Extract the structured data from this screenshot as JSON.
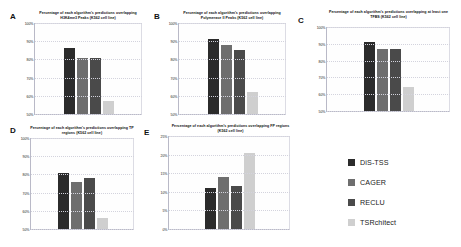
{
  "figure": {
    "background": "#ffffff",
    "series_colors": [
      "#2b2b2b",
      "#6e6e6e",
      "#4a4a4a",
      "#cfcfcf"
    ],
    "series_names": [
      "DiS-TSS",
      "CAGER",
      "RECLU",
      "TSRchitect"
    ]
  },
  "legend": {
    "items": [
      {
        "label": "DiS-TSS",
        "color": "#2b2b2b"
      },
      {
        "label": "CAGER",
        "color": "#6e6e6e"
      },
      {
        "label": "RECLU",
        "color": "#4a4a4a"
      },
      {
        "label": "TSRchitect",
        "color": "#cfcfcf"
      }
    ]
  },
  "panels": [
    {
      "letter": "A",
      "title": "Percentage of each algorithm's predictions overlapping H3K4me3 Peaks (K562 cell line)",
      "yticks": [
        "100%",
        "90%",
        "80%",
        "70%",
        "60%",
        "50%"
      ],
      "chart_data": {
        "type": "bar",
        "title": "Percentage of each algorithm's predictions overlapping H3K4me3 Peaks (K562 cell line)",
        "categories": [
          "DiS-TSS",
          "CAGER",
          "RECLU",
          "TSRchitect"
        ],
        "values": [
          86,
          81,
          81,
          57
        ],
        "xlabel": "",
        "ylabel": "",
        "ylim": [
          50,
          100
        ],
        "grid": false,
        "legend_position": "right-external"
      }
    },
    {
      "letter": "B",
      "title": "Percentage of each algorithm's predictions overlapping Polymerase II Peaks (K562 cell line)",
      "yticks": [
        "100%",
        "90%",
        "80%",
        "70%",
        "60%",
        "50%"
      ],
      "chart_data": {
        "type": "bar",
        "title": "Percentage of each algorithm's predictions overlapping Polymerase II Peaks (K562 cell line)",
        "categories": [
          "DiS-TSS",
          "CAGER",
          "RECLU",
          "TSRchitect"
        ],
        "values": [
          91,
          88,
          85,
          62
        ],
        "xlabel": "",
        "ylabel": "",
        "ylim": [
          50,
          100
        ],
        "grid": false,
        "legend_position": "right-external"
      }
    },
    {
      "letter": "C",
      "title": "Percentage of each algorithm's predictions overlapping at least one TFBS (K562 cell line)",
      "yticks": [
        "100%",
        "90%",
        "80%",
        "70%",
        "60%",
        "50%"
      ],
      "chart_data": {
        "type": "bar",
        "title": "Percentage of each algorithm's predictions overlapping at least one TFBS (K562 cell line)",
        "categories": [
          "DiS-TSS",
          "CAGER",
          "RECLU",
          "TSRchitect"
        ],
        "values": [
          91,
          87,
          87,
          64
        ],
        "xlabel": "",
        "ylabel": "",
        "ylim": [
          50,
          100
        ],
        "grid": false,
        "legend_position": "right-external"
      }
    },
    {
      "letter": "D",
      "title": "Percentage of each algorithm's predictions overlapping TP regions (K562 cell line)",
      "yticks": [
        "100%",
        "90%",
        "80%",
        "70%",
        "60%",
        "50%"
      ],
      "chart_data": {
        "type": "bar",
        "title": "Percentage of each algorithm's predictions overlapping TP regions (K562 cell line)",
        "categories": [
          "DiS-TSS",
          "CAGER",
          "RECLU",
          "TSRchitect"
        ],
        "values": [
          81,
          76,
          78,
          56
        ],
        "xlabel": "",
        "ylabel": "",
        "ylim": [
          50,
          100
        ],
        "grid": false,
        "legend_position": "right-external"
      }
    },
    {
      "letter": "E",
      "title": "Percentage of each algorithm's predictions overlapping FP regions (K562 cell line)",
      "yticks": [
        "25%",
        "20%",
        "15%",
        "10%",
        "5%",
        "0%"
      ],
      "chart_data": {
        "type": "bar",
        "title": "Percentage of each algorithm's predictions overlapping FP regions (K562 cell line)",
        "categories": [
          "DiS-TSS",
          "CAGER",
          "RECLU",
          "TSRchitect"
        ],
        "values": [
          11,
          14,
          11.5,
          20.5
        ],
        "xlabel": "",
        "ylabel": "",
        "ylim": [
          0,
          25
        ],
        "grid": false,
        "legend_position": "right-external"
      }
    }
  ]
}
